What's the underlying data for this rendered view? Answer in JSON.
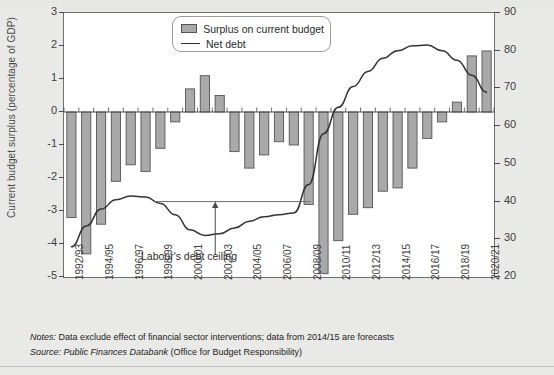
{
  "figure": {
    "background_color": "#e9e9e7",
    "plot_background_color": "#ffffff",
    "bar_color": "#a9a9a9",
    "bar_border_color": "#545454",
    "line_color": "#333333"
  },
  "legend": {
    "position": "top-center",
    "items": [
      {
        "label": "Surplus on current budget",
        "marker": "bar-swatch"
      },
      {
        "label": "Net debt",
        "marker": "line-swatch"
      }
    ]
  },
  "annotation": {
    "label": "Labour's debt ceiling",
    "value_right_axis": 40,
    "value_left_axis": -2.75,
    "arrow": "up-arrow-icon"
  },
  "notes": {
    "notes_prefix": "Notes:",
    "notes_text": " Data exclude effect of financial sector interventions; data from 2014/15 are forecasts",
    "source_prefix": "Source:",
    "source_italic": " Public Finances Databank",
    "source_rest": " (Office for Budget Responsibility)"
  },
  "chart_data": {
    "type": "bar",
    "title": "",
    "xlabel": "",
    "ylabel": "Current budget surplus (percentage of GDP)",
    "ylabel_right": "Net debt (percentage of GDP)",
    "ylim": [
      -5,
      3
    ],
    "yticks": [
      3,
      2,
      1,
      0,
      -1,
      -2,
      -3,
      -4,
      -5
    ],
    "ylim_right": [
      20,
      90
    ],
    "yticks_right": [
      90,
      80,
      70,
      60,
      50,
      40,
      30,
      20
    ],
    "grid": false,
    "legend_position": "top-center",
    "categories": [
      "1992/93",
      "1993/94",
      "1994/95",
      "1995/96",
      "1996/97",
      "1997/98",
      "1998/99",
      "1999/00",
      "2000/01",
      "2001/02",
      "2002/03",
      "2003/04",
      "2004/05",
      "2005/06",
      "2006/07",
      "2007/08",
      "2008/09",
      "2009/10",
      "2010/11",
      "2011/12",
      "2012/13",
      "2013/14",
      "2014/15",
      "2015/16",
      "2016/17",
      "2017/18",
      "2018/19",
      "2019/20",
      "2020/21"
    ],
    "xtick_labels": [
      "1992/93",
      "1994/95",
      "1996/97",
      "1998/99",
      "2000/01",
      "2002/03",
      "2004/05",
      "2006/07",
      "2008/09",
      "2010/11",
      "2012/13",
      "2014/15",
      "2016/17",
      "2018/19",
      "2020/21"
    ],
    "series": [
      {
        "name": "Surplus on current budget",
        "axis": "left",
        "type": "bar",
        "values": [
          -3.2,
          -4.3,
          -3.4,
          -2.1,
          -1.6,
          -1.8,
          -1.1,
          -0.3,
          0.7,
          1.1,
          0.5,
          -1.2,
          -1.7,
          -1.3,
          -0.9,
          -1.0,
          -2.8,
          -4.9,
          -3.9,
          -3.1,
          -2.9,
          -2.4,
          -2.3,
          -1.7,
          -0.8,
          -0.3,
          0.3,
          1.7,
          1.85
        ]
      },
      {
        "name": "Net debt",
        "axis": "right",
        "type": "line",
        "values": [
          28.0,
          33.5,
          38.0,
          40.5,
          41.5,
          41.2,
          39.5,
          36.5,
          32.5,
          31.0,
          31.5,
          33.0,
          34.8,
          36.0,
          36.5,
          37.0,
          44.5,
          58.0,
          65.0,
          70.5,
          74.5,
          78.0,
          80.0,
          81.3,
          81.5,
          80.0,
          77.5,
          73.5,
          69.0
        ]
      }
    ]
  }
}
